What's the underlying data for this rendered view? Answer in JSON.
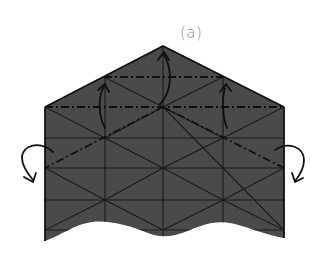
{
  "figure": {
    "label": "(a)",
    "colors": {
      "paper_fill": "#4a4a4a",
      "crease_line": "#1a1a1a",
      "outline": "#111111",
      "arrow": "#111111",
      "label": "#8a8a8a",
      "background": "#ffffff"
    },
    "shape": {
      "apex": [
        163,
        46
      ],
      "left_shoulder": [
        45,
        107
      ],
      "right_shoulder": [
        284,
        107
      ],
      "left_bottom": [
        45,
        241
      ],
      "right_bottom": [
        284,
        238
      ]
    },
    "grid": {
      "verticals_x": [
        105,
        163,
        223
      ],
      "horizontals_y": [
        138,
        168,
        200,
        230
      ]
    },
    "valley_folds": [
      {
        "name": "upper-horizontal",
        "from": [
          104,
          77
        ],
        "to": [
          223,
          77
        ]
      },
      {
        "name": "shoulder-horizontal",
        "from": [
          45,
          107
        ],
        "to": [
          284,
          107
        ]
      },
      {
        "name": "left-diagonal",
        "from": [
          163,
          107
        ],
        "to": [
          45,
          168
        ]
      },
      {
        "name": "right-diagonal",
        "from": [
          163,
          107
        ],
        "to": [
          284,
          168
        ]
      },
      {
        "name": "upper-left-diagonal",
        "from": [
          104,
          77
        ],
        "to": [
          163,
          107
        ]
      },
      {
        "name": "upper-right-diagonal",
        "from": [
          223,
          77
        ],
        "to": [
          163,
          107
        ]
      }
    ],
    "arrows": [
      {
        "name": "fold-up-left",
        "direction": "up"
      },
      {
        "name": "fold-up-center",
        "direction": "up"
      },
      {
        "name": "fold-up-right",
        "direction": "up"
      },
      {
        "name": "fold-behind-left",
        "direction": "behind"
      },
      {
        "name": "fold-behind-right",
        "direction": "behind"
      }
    ]
  }
}
